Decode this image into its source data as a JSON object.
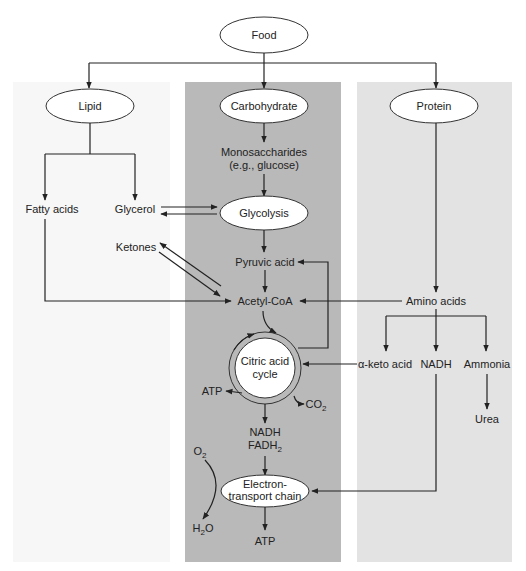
{
  "colors": {
    "lipid_panel": "#f7f7f7",
    "carbohydrate_panel": "#b9b9b9",
    "protein_panel": "#e3e3e3",
    "line": "#222222"
  },
  "nodes": {
    "food": "Food",
    "lipid": "Lipid",
    "carbohydrate": "Carbohydrate",
    "protein": "Protein",
    "monosaccharides_1": "Monosaccharides",
    "monosaccharides_2": "(e.g., glucose)",
    "fatty_acids": "Fatty acids",
    "glycerol": "Glycerol",
    "glycolysis": "Glycolysis",
    "ketones": "Ketones",
    "pyruvic_acid": "Pyruvic acid",
    "acetyl_coa": "Acetyl-CoA",
    "amino_acids": "Amino acids",
    "citric_1": "Citric acid",
    "citric_2": "cycle",
    "alpha_keto": "α-keto acid",
    "nadh_protein": "NADH",
    "ammonia": "Ammonia",
    "urea": "Urea",
    "atp_cycle": "ATP",
    "co2": "CO",
    "co2_sub": "2",
    "nadh": "NADH",
    "fadh": "FADH",
    "fadh_sub": "2",
    "o2": "O",
    "o2_sub": "2",
    "etc_1": "Electron-",
    "etc_2": "transport chain",
    "h2o_h": "H",
    "h2o_sub": "2",
    "h2o_o": "O",
    "atp_final": "ATP"
  }
}
